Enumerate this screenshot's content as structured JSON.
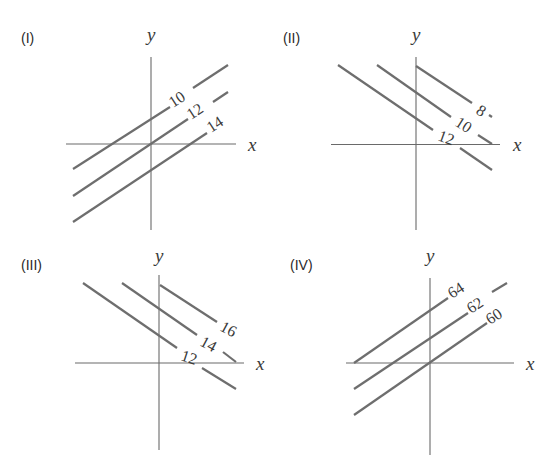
{
  "figure": {
    "panels": [
      {
        "id": "I",
        "label": "(I)",
        "x_axis_label": "x",
        "y_axis_label": "y",
        "contour_values": [
          "10",
          "12",
          "14"
        ],
        "slope_direction": "positive"
      },
      {
        "id": "II",
        "label": "(II)",
        "x_axis_label": "x",
        "y_axis_label": "y",
        "contour_values": [
          "8",
          "10",
          "12"
        ],
        "slope_direction": "negative"
      },
      {
        "id": "III",
        "label": "(III)",
        "x_axis_label": "x",
        "y_axis_label": "y",
        "contour_values": [
          "16",
          "14",
          "12"
        ],
        "slope_direction": "negative"
      },
      {
        "id": "IV",
        "label": "(IV)",
        "x_axis_label": "x",
        "y_axis_label": "y",
        "contour_values": [
          "64",
          "62",
          "60"
        ],
        "slope_direction": "positive"
      }
    ],
    "colors": {
      "lines": "#6e6e6e",
      "axes": "#6a6a6a",
      "text": "#3a3a3a",
      "background": "#ffffff"
    }
  }
}
